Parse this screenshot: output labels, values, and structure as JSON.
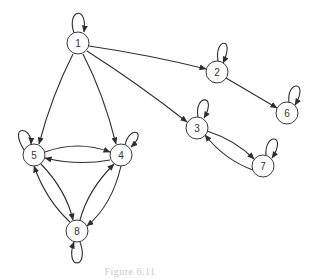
{
  "caption": "Figure 6.11",
  "colors": {
    "stroke": "#2e2e2e",
    "node_fill": "#ffffff",
    "caption": "#c8c8c8"
  },
  "graph": {
    "type": "directed",
    "nodes": [
      {
        "id": "1",
        "label": "1"
      },
      {
        "id": "2",
        "label": "2"
      },
      {
        "id": "3",
        "label": "3"
      },
      {
        "id": "4",
        "label": "4"
      },
      {
        "id": "5",
        "label": "5"
      },
      {
        "id": "6",
        "label": "6"
      },
      {
        "id": "7",
        "label": "7"
      },
      {
        "id": "8",
        "label": "8"
      }
    ],
    "edges": [
      {
        "from": "1",
        "to": "1"
      },
      {
        "from": "1",
        "to": "2"
      },
      {
        "from": "1",
        "to": "3"
      },
      {
        "from": "1",
        "to": "4"
      },
      {
        "from": "1",
        "to": "5"
      },
      {
        "from": "2",
        "to": "2"
      },
      {
        "from": "2",
        "to": "6"
      },
      {
        "from": "6",
        "to": "6"
      },
      {
        "from": "3",
        "to": "3"
      },
      {
        "from": "3",
        "to": "7"
      },
      {
        "from": "7",
        "to": "3"
      },
      {
        "from": "7",
        "to": "7"
      },
      {
        "from": "5",
        "to": "5"
      },
      {
        "from": "5",
        "to": "4"
      },
      {
        "from": "4",
        "to": "5"
      },
      {
        "from": "4",
        "to": "4"
      },
      {
        "from": "5",
        "to": "8"
      },
      {
        "from": "8",
        "to": "5"
      },
      {
        "from": "4",
        "to": "8"
      },
      {
        "from": "8",
        "to": "4"
      },
      {
        "from": "8",
        "to": "8"
      }
    ]
  }
}
